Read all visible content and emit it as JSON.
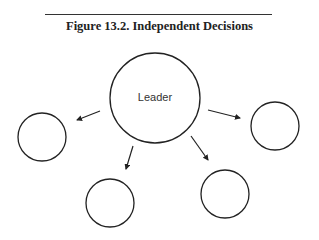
{
  "figure": {
    "title": "Figure 13.2.  Independent Decisions"
  },
  "diagram": {
    "center_node": {
      "label": "Leader"
    },
    "nodes": [
      {
        "id": "left",
        "label": ""
      },
      {
        "id": "right",
        "label": ""
      },
      {
        "id": "bottom-left",
        "label": ""
      },
      {
        "id": "bottom-right",
        "label": ""
      }
    ],
    "edges": [
      {
        "from": "Leader",
        "to": "left"
      },
      {
        "from": "Leader",
        "to": "right"
      },
      {
        "from": "Leader",
        "to": "bottom-left"
      },
      {
        "from": "Leader",
        "to": "bottom-right"
      }
    ]
  }
}
